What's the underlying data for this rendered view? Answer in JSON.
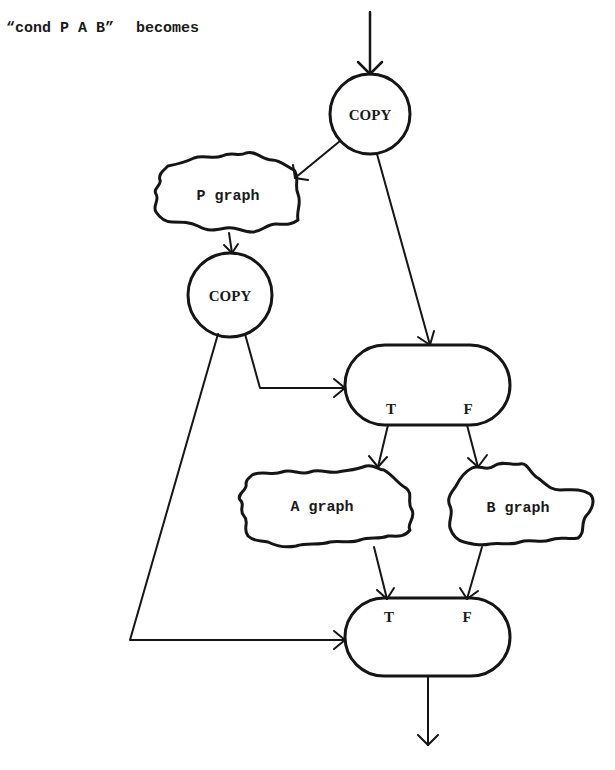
{
  "caption": {
    "expression": "“cond P A B”",
    "verb": "becomes"
  },
  "nodes": {
    "copy_top": {
      "label": "COPY",
      "shape": "circle"
    },
    "p_graph": {
      "label": "P graph",
      "shape": "cloud"
    },
    "copy_mid": {
      "label": "COPY",
      "shape": "circle"
    },
    "switch": {
      "shape": "stadium",
      "ports": {
        "true": "T",
        "false": "F"
      }
    },
    "a_graph": {
      "label": "A graph",
      "shape": "cloud"
    },
    "b_graph": {
      "label": "B graph",
      "shape": "cloud"
    },
    "merge": {
      "shape": "stadium",
      "ports": {
        "true": "T",
        "false": "F"
      }
    }
  },
  "edges": [
    {
      "from": "input",
      "to": "copy_top"
    },
    {
      "from": "copy_top",
      "to": "p_graph"
    },
    {
      "from": "copy_top",
      "to": "switch"
    },
    {
      "from": "p_graph",
      "to": "copy_mid"
    },
    {
      "from": "copy_mid",
      "to": "switch",
      "port": "control"
    },
    {
      "from": "copy_mid",
      "to": "merge",
      "port": "control"
    },
    {
      "from": "switch",
      "port": "T",
      "to": "a_graph"
    },
    {
      "from": "switch",
      "port": "F",
      "to": "b_graph"
    },
    {
      "from": "a_graph",
      "to": "merge",
      "port": "T"
    },
    {
      "from": "b_graph",
      "to": "merge",
      "port": "F"
    },
    {
      "from": "merge",
      "to": "output"
    }
  ]
}
